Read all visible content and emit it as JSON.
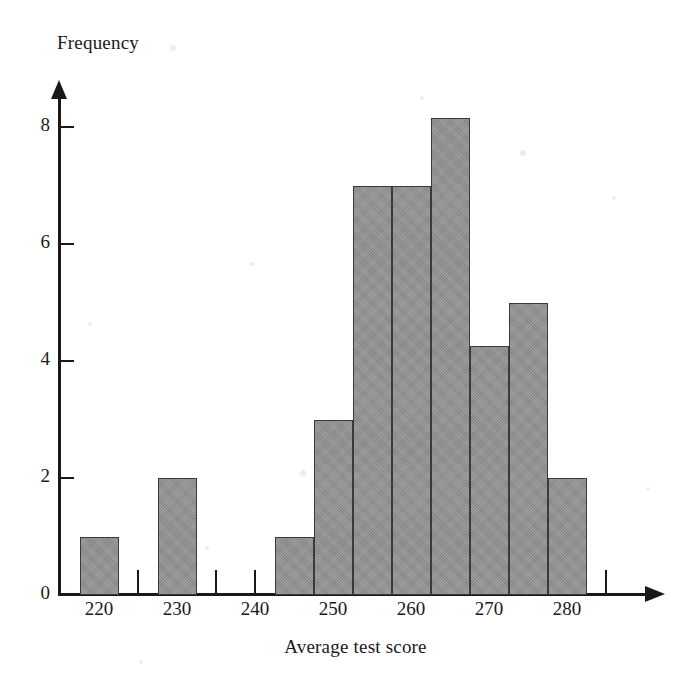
{
  "figure": {
    "kind": "histogram-figure",
    "background_color": "#ffffff",
    "bar_fill_color": "#8e8e8e",
    "bar_border_color": "#3a3a3a",
    "axis_color": "#191919"
  },
  "axes": {
    "y_title": "Frequency",
    "x_title": "Average test score",
    "y_ticks": [
      {
        "label": "0",
        "value": 0
      },
      {
        "label": "2",
        "value": 2
      },
      {
        "label": "4",
        "value": 4
      },
      {
        "label": "6",
        "value": 6
      },
      {
        "label": "8",
        "value": 8
      }
    ],
    "x_ticks": [
      {
        "label": "",
        "value": 215
      },
      {
        "label": "220",
        "value": 220
      },
      {
        "label": "",
        "value": 225
      },
      {
        "label": "230",
        "value": 230
      },
      {
        "label": "",
        "value": 235
      },
      {
        "label": "240",
        "value": 240
      },
      {
        "label": "",
        "value": 245
      },
      {
        "label": "250",
        "value": 250
      },
      {
        "label": "",
        "value": 255
      },
      {
        "label": "260",
        "value": 260
      },
      {
        "label": "",
        "value": 265
      },
      {
        "label": "270",
        "value": 270
      },
      {
        "label": "",
        "value": 275
      },
      {
        "label": "280",
        "value": 280
      },
      {
        "label": "",
        "value": 285
      }
    ]
  },
  "chart_data": {
    "type": "bar",
    "title": "",
    "subtitle": "",
    "xlabel": "Average test score",
    "ylabel": "Frequency",
    "xlim": [
      213,
      288
    ],
    "ylim": [
      0,
      8.6
    ],
    "grid": false,
    "legend": null,
    "bin_width": 5,
    "bin_centers": [
      220,
      225,
      230,
      235,
      240,
      245,
      250,
      255,
      260,
      265,
      270,
      275,
      280,
      285
    ],
    "categories": [
      "217.5-222.5",
      "222.5-227.5",
      "227.5-232.5",
      "232.5-237.5",
      "237.5-242.5",
      "242.5-247.5",
      "247.5-252.5",
      "252.5-257.5",
      "257.5-262.5",
      "262.5-267.5",
      "267.5-272.5",
      "272.5-277.5",
      "277.5-282.5",
      "282.5-287.5"
    ],
    "values": [
      1,
      0,
      2,
      0,
      0,
      1,
      3,
      7,
      7,
      8.15,
      4.25,
      5,
      2,
      0
    ],
    "bars": [
      {
        "center": 220,
        "x0": 217.5,
        "x1": 222.5,
        "height": 1
      },
      {
        "center": 230,
        "x0": 227.5,
        "x1": 232.5,
        "height": 2
      },
      {
        "center": 245,
        "x0": 242.5,
        "x1": 247.5,
        "height": 1
      },
      {
        "center": 250,
        "x0": 247.5,
        "x1": 252.5,
        "height": 3
      },
      {
        "center": 255,
        "x0": 252.5,
        "x1": 257.5,
        "height": 7
      },
      {
        "center": 260,
        "x0": 257.5,
        "x1": 262.5,
        "height": 7
      },
      {
        "center": 265,
        "x0": 262.5,
        "x1": 267.5,
        "height": 8.15
      },
      {
        "center": 270,
        "x0": 267.5,
        "x1": 272.5,
        "height": 4.25
      },
      {
        "center": 275,
        "x0": 272.5,
        "x1": 277.5,
        "height": 5
      },
      {
        "center": 280,
        "x0": 277.5,
        "x1": 282.5,
        "height": 2
      }
    ]
  }
}
